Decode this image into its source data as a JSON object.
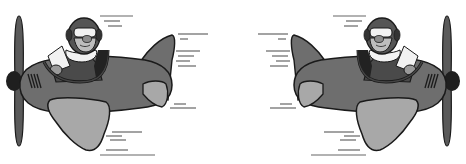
{
  "image": {
    "description": "Two cartoon airplanes with pilots, facing each other, grayscale",
    "planes": [
      {
        "id": "left",
        "direction": "left",
        "label": "Plane facing left"
      },
      {
        "id": "right",
        "direction": "right",
        "label": "Plane facing right"
      }
    ],
    "colors": {
      "fuselage": "#6e6e6e",
      "wing": "#a8a8a8",
      "outline": "#1a1a1a",
      "propeller": "#5a5a5a",
      "helmet": "#555555",
      "face": "#bdbdbd",
      "scarf": "#f2f2f2",
      "jacket": "#4a4a4a",
      "speedlines": "#666666",
      "background": "#ffffff"
    }
  }
}
